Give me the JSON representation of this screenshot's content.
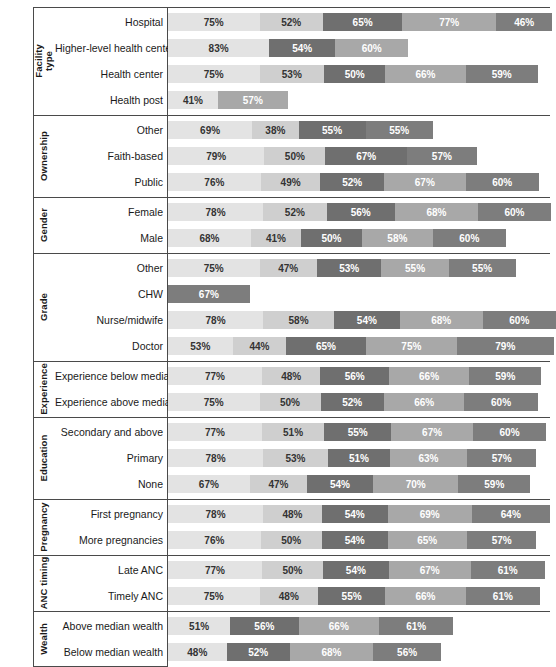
{
  "chart_data": {
    "type": "bar",
    "subtype": "stacked-horizontal-segments",
    "title": "",
    "xlabel": "",
    "ylabel": "",
    "grid": false,
    "legend": "none",
    "value_unit": "%",
    "scale_px_per_percent": 1.22,
    "segment_colors": [
      "#e3e3e3",
      "#cfcfcf",
      "#6f6f6f",
      "#a8a8a8",
      "#7d7d7d"
    ],
    "groups": [
      {
        "name": "Facility type",
        "rows": [
          {
            "label": "Hospital",
            "values": [
              75,
              52,
              65,
              77,
              46
            ],
            "colors": [
              0,
              1,
              2,
              3,
              4
            ]
          },
          {
            "label": "Higher-level health center",
            "values": [
              83,
              54,
              60
            ],
            "colors": [
              0,
              2,
              3
            ]
          },
          {
            "label": "Health center",
            "values": [
              75,
              53,
              50,
              66,
              59
            ],
            "colors": [
              0,
              1,
              2,
              3,
              4
            ]
          },
          {
            "label": "Health post",
            "values": [
              41,
              57
            ],
            "colors": [
              0,
              3
            ]
          }
        ]
      },
      {
        "name": "Ownership",
        "rows": [
          {
            "label": "Other",
            "values": [
              69,
              38,
              55,
              55
            ],
            "colors": [
              0,
              1,
              2,
              4
            ]
          },
          {
            "label": "Faith-based",
            "values": [
              79,
              50,
              67,
              57
            ],
            "colors": [
              0,
              1,
              2,
              4
            ]
          },
          {
            "label": "Public",
            "values": [
              76,
              49,
              52,
              67,
              60
            ],
            "colors": [
              0,
              1,
              2,
              3,
              4
            ]
          }
        ]
      },
      {
        "name": "Gender",
        "rows": [
          {
            "label": "Female",
            "values": [
              78,
              52,
              56,
              68,
              60
            ],
            "colors": [
              0,
              1,
              2,
              3,
              4
            ]
          },
          {
            "label": "Male",
            "values": [
              68,
              41,
              50,
              58,
              60
            ],
            "colors": [
              0,
              1,
              2,
              3,
              4
            ]
          }
        ]
      },
      {
        "name": "Grade",
        "rows": [
          {
            "label": "Other",
            "values": [
              75,
              47,
              53,
              55,
              55
            ],
            "colors": [
              0,
              1,
              2,
              3,
              4
            ]
          },
          {
            "label": "CHW",
            "values": [
              67
            ],
            "colors": [
              4
            ]
          },
          {
            "label": "Nurse/midwife",
            "values": [
              78,
              58,
              54,
              68,
              60
            ],
            "colors": [
              0,
              1,
              2,
              3,
              4
            ]
          },
          {
            "label": "Doctor",
            "values": [
              53,
              44,
              65,
              75,
              79
            ],
            "colors": [
              0,
              1,
              2,
              3,
              4
            ]
          }
        ]
      },
      {
        "name": "Experience",
        "rows": [
          {
            "label": "Experience below median",
            "values": [
              77,
              48,
              56,
              66,
              59
            ],
            "colors": [
              0,
              1,
              2,
              3,
              4
            ]
          },
          {
            "label": "Experience above median",
            "values": [
              75,
              50,
              52,
              66,
              60
            ],
            "colors": [
              0,
              1,
              2,
              3,
              4
            ]
          }
        ]
      },
      {
        "name": "Education",
        "rows": [
          {
            "label": "Secondary and above",
            "values": [
              77,
              51,
              55,
              67,
              60
            ],
            "colors": [
              0,
              1,
              2,
              3,
              4
            ]
          },
          {
            "label": "Primary",
            "values": [
              78,
              53,
              51,
              63,
              57
            ],
            "colors": [
              0,
              1,
              2,
              3,
              4
            ]
          },
          {
            "label": "None",
            "values": [
              67,
              47,
              54,
              70,
              59
            ],
            "colors": [
              0,
              1,
              2,
              3,
              4
            ]
          }
        ]
      },
      {
        "name": "Pregnancy",
        "rows": [
          {
            "label": "First pregnancy",
            "values": [
              78,
              48,
              54,
              69,
              64
            ],
            "colors": [
              0,
              1,
              2,
              3,
              4
            ]
          },
          {
            "label": "More pregnancies",
            "values": [
              76,
              50,
              54,
              65,
              57
            ],
            "colors": [
              0,
              1,
              2,
              3,
              4
            ]
          }
        ]
      },
      {
        "name": "ANC timing",
        "rows": [
          {
            "label": "Late ANC",
            "values": [
              77,
              50,
              54,
              67,
              61
            ],
            "colors": [
              0,
              1,
              2,
              3,
              4
            ]
          },
          {
            "label": "Timely ANC",
            "values": [
              75,
              48,
              55,
              66,
              61
            ],
            "colors": [
              0,
              1,
              2,
              3,
              4
            ]
          }
        ]
      },
      {
        "name": "Wealth",
        "rows": [
          {
            "label": "Above median wealth",
            "values": [
              51,
              56,
              66,
              61
            ],
            "colors": [
              0,
              2,
              3,
              4
            ]
          },
          {
            "label": "Below median wealth",
            "values": [
              48,
              52,
              68,
              56
            ],
            "colors": [
              0,
              2,
              3,
              4
            ]
          }
        ]
      }
    ]
  }
}
